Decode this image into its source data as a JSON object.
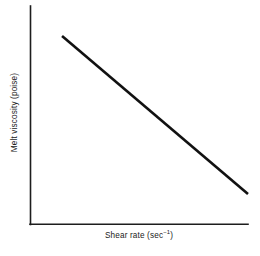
{
  "chart_data": {
    "type": "line",
    "title": "",
    "subtitle": "",
    "xlabel_text": "Shear rate (sec",
    "xlabel_exponent": "−1",
    "xlabel_close": ")",
    "xlabel": "Shear rate (sec⁻¹)",
    "ylabel_text": "Melt viscosity (poise)",
    "ylabel": "Melt viscosity (poise)",
    "grid": false,
    "legend": "none",
    "ticks": "none",
    "tick_labels_x": [],
    "tick_labels_y": [],
    "xlim": [
      0,
      1
    ],
    "ylim": [
      0,
      1
    ],
    "series": [
      {
        "name": "melt viscosity vs shear rate",
        "x": [
          0.147,
          1.0
        ],
        "y": [
          0.862,
          0.138
        ],
        "trend": "decreasing",
        "style": "solid",
        "color": "#111111",
        "width_px": 2.6
      }
    ],
    "annotations": [],
    "axis_color": "#1d1d1d",
    "background_color": "#ffffff"
  },
  "figure": {
    "width": 260,
    "height": 256
  }
}
